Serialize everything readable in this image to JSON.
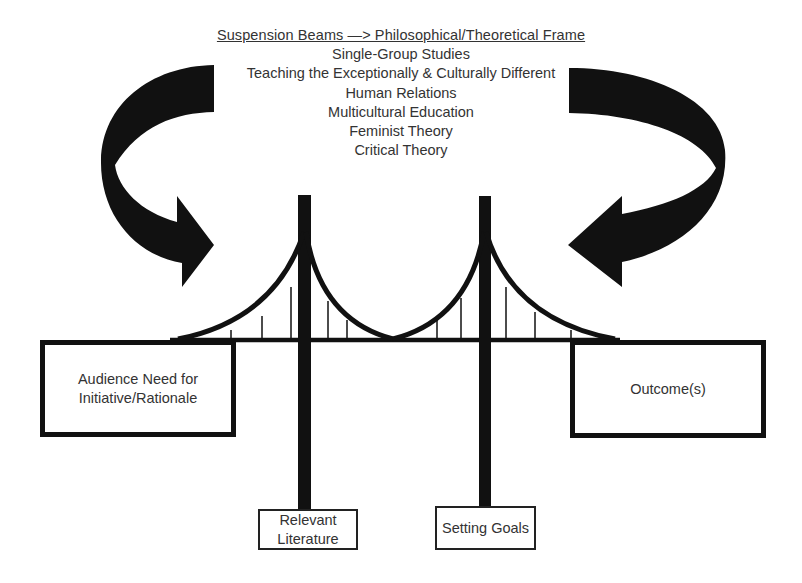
{
  "frame": {
    "heading": "Suspension Beams  —> Philosophical/Theoretical Frame",
    "items": [
      "Single-Group Studies",
      "Teaching the Exceptionally & Culturally Different",
      "Human Relations",
      "Multicultural Education",
      "Feminist Theory",
      "Critical Theory"
    ]
  },
  "boxes": {
    "left_anchor": {
      "line1": "Audience Need for",
      "line2": "Initiative/Rationale"
    },
    "right_anchor": {
      "label": "Outcome(s)"
    },
    "left_pillar": {
      "line1": "Relevant",
      "line2": "Literature"
    },
    "right_pillar": {
      "label": "Setting Goals"
    }
  },
  "icons": {
    "left_arrow": "curved-arrow-right",
    "right_arrow": "curved-arrow-left",
    "bridge": "suspension-bridge"
  },
  "colors": {
    "ink": "#111111",
    "text": "#333333",
    "background": "#ffffff"
  }
}
